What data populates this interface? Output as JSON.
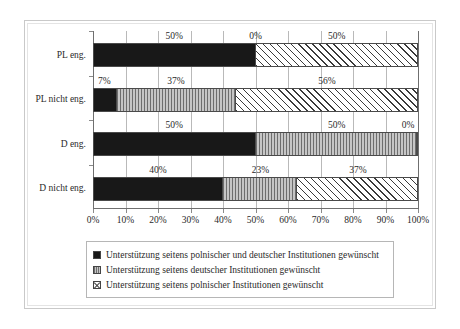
{
  "chart_data": {
    "type": "bar",
    "orientation": "horizontal",
    "stacked": true,
    "stack_mode": "percent",
    "title": "",
    "subtitle": "",
    "xlabel": "",
    "ylabel": "",
    "xlim": [
      0,
      100
    ],
    "grid": true,
    "legend_position": "bottom",
    "categories": [
      "PL eng.",
      "PL nicht eng.",
      "D eng.",
      "D nicht eng."
    ],
    "tick_labels": [
      "0%",
      "10%",
      "20%",
      "30%",
      "40%",
      "50%",
      "60%",
      "70%",
      "80%",
      "90%",
      "100%"
    ],
    "tick_values": [
      0,
      10,
      20,
      30,
      40,
      50,
      60,
      70,
      80,
      90,
      100
    ],
    "series": [
      {
        "name": "Unterstützung seitens polnischer und deutscher Institutionen gewünscht",
        "pattern": "solid-black",
        "color": "#181818",
        "values": [
          50,
          7,
          50,
          40
        ],
        "labels": [
          "50%",
          "7%",
          "50%",
          "40%"
        ]
      },
      {
        "name": "Unterstützung seitens deutscher Institutionen gewünscht",
        "pattern": "gray-vertical-lines",
        "color": "#9a9a9a",
        "values": [
          0,
          37,
          50,
          23
        ],
        "labels": [
          "0%",
          "37%",
          "50%",
          "23%"
        ]
      },
      {
        "name": "Unterstützung seitens polnischer Institutionen gewünscht",
        "pattern": "white-crosshatch",
        "color": "#ffffff",
        "values": [
          50,
          56,
          0,
          37
        ],
        "labels": [
          "50%",
          "56%",
          "0%",
          "37%"
        ]
      }
    ]
  },
  "legend": {
    "items": [
      {
        "label": "Unterstützung seitens polnischer und deutscher Institutionen gewünscht"
      },
      {
        "label": "Unterstützung seitens deutscher Institutionen gewünscht"
      },
      {
        "label": "Unterstützung seitens polnischer Institutionen gewünscht"
      }
    ]
  }
}
